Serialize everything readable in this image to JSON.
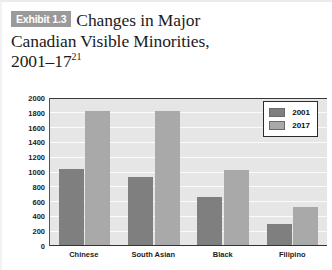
{
  "exhibit": {
    "badge": "Exhibit 1.3",
    "title_line1": "Changes in Major",
    "title_line2": "Canadian Visible Minorities,",
    "title_line3": "2001–17",
    "footnote_marker": "21"
  },
  "legend": {
    "items": [
      {
        "label": "2001",
        "color": "#7f7f7f"
      },
      {
        "label": "2017",
        "color": "#a9a9a9"
      }
    ]
  },
  "chart_data": {
    "type": "bar",
    "title": "Changes in Major Canadian Visible Minorities, 2001–17",
    "xlabel": "",
    "ylabel": "",
    "ylim": [
      0,
      2000
    ],
    "yticks": [
      0,
      200,
      400,
      600,
      800,
      1000,
      1200,
      1400,
      1600,
      1800,
      2000
    ],
    "ytick_labels": [
      "0",
      "200",
      "400",
      "600",
      "800",
      "1000",
      "1200",
      "1400",
      "1600",
      "1800",
      "2000"
    ],
    "grid": true,
    "legend_position": "top-right",
    "categories": [
      "Chinese",
      "South Asian",
      "Black",
      "Filipino"
    ],
    "series": [
      {
        "name": "2001",
        "color": "#7f7f7f",
        "values": [
          1030,
          920,
          655,
          290
        ]
      },
      {
        "name": "2017",
        "color": "#a9a9a9",
        "values": [
          1810,
          1810,
          1020,
          510
        ]
      }
    ]
  }
}
